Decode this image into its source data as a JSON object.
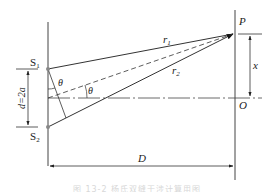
{
  "diagram": {
    "labels": {
      "slit_top": "S",
      "slit_top_sub": "1",
      "slit_bottom": "S",
      "slit_bottom_sub": "2",
      "point_p": "P",
      "point_o": "O",
      "ray1": "r",
      "ray1_sub": "1",
      "ray2": "r",
      "ray2_sub": "2",
      "angle1": "θ",
      "angle2": "θ",
      "slit_separation": "d=2a",
      "screen_offset": "x",
      "screen_distance": "D"
    },
    "colors": {
      "line": "#333333",
      "point": "#888888",
      "caption": "#d8d8d8"
    }
  },
  "caption": "图 13-2  杨氏双缝干涉计算用图"
}
